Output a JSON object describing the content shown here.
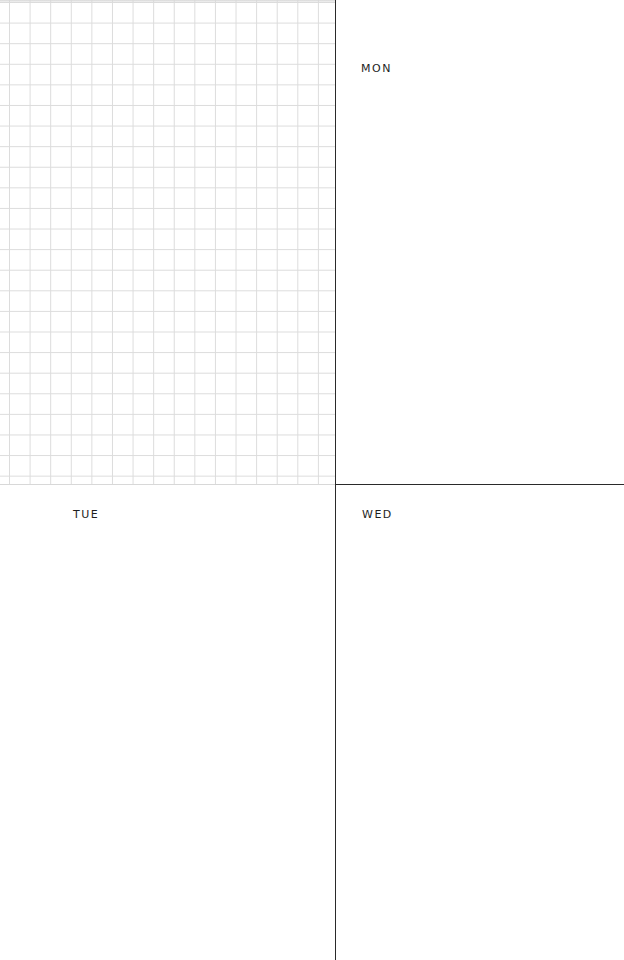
{
  "planner": {
    "notes_panel": {
      "style": "grid"
    },
    "days": [
      {
        "label": "MON"
      },
      {
        "label": "TUE"
      },
      {
        "label": "WED"
      }
    ]
  },
  "colors": {
    "grid_line": "#dcdcdc",
    "divider": "#2a2a2a",
    "text": "#1e1e1e",
    "background": "#ffffff"
  }
}
